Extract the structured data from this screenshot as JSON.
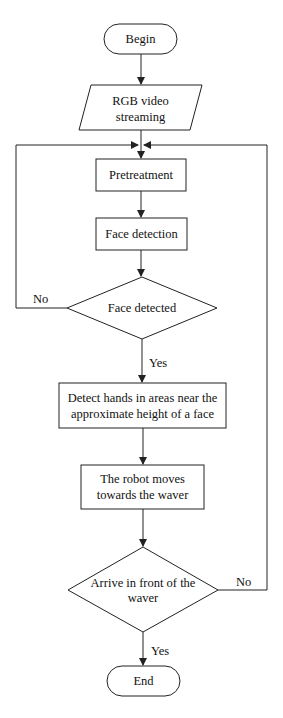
{
  "diagram": {
    "type": "flowchart",
    "line_color": "#222222",
    "nodes": {
      "begin": {
        "label": "Begin",
        "shape": "terminator"
      },
      "input": {
        "label_line1": "RGB video",
        "label_line2": "streaming",
        "shape": "parallelogram"
      },
      "pretreatment": {
        "label": "Pretreatment",
        "shape": "process"
      },
      "face_detection": {
        "label": "Face detection",
        "shape": "process"
      },
      "face_detected": {
        "label": "Face detected",
        "shape": "decision"
      },
      "detect_hands": {
        "label_line1": "Detect hands in areas near the",
        "label_line2": "approximate height of a face",
        "shape": "process"
      },
      "robot_moves": {
        "label_line1": "The robot moves",
        "label_line2": "towards the waver",
        "shape": "process"
      },
      "arrive": {
        "label_line1": "Arrive in front of the",
        "label_line2": "waver",
        "shape": "decision"
      },
      "end": {
        "label": "End",
        "shape": "terminator"
      }
    },
    "edges": {
      "face_no": "No",
      "face_yes": "Yes",
      "arrive_no": "No",
      "arrive_yes": "Yes"
    }
  }
}
